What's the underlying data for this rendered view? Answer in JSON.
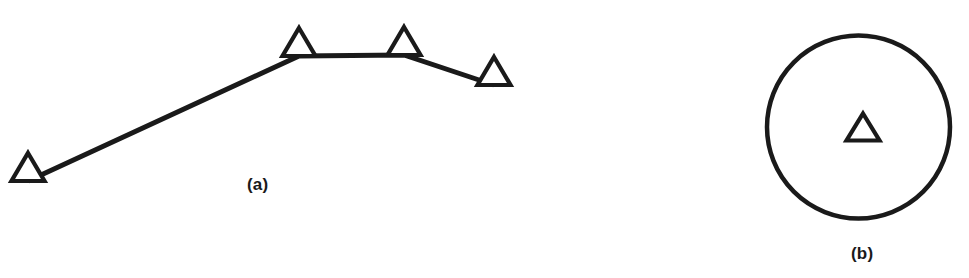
{
  "figure": {
    "background_color": "#ffffff",
    "stroke_color": "#1a1a1a",
    "width": 969,
    "height": 278
  },
  "panels": [
    {
      "id": "a",
      "caption": "(a)",
      "description": "open-triangle markers connected by straight line segments"
    },
    {
      "id": "b",
      "caption": "(b)",
      "description": "single open-triangle marker centered inside a large circle"
    }
  ],
  "chart_data": {
    "type": "line",
    "title": "",
    "xlabel": "",
    "ylabel": "",
    "grid": false,
    "legend": null,
    "xlim": [
      0,
      969
    ],
    "ylim": [
      278,
      0
    ],
    "marker": "open-triangle",
    "line_color": "#1a1a1a",
    "line_width": 5,
    "marker_line_width": 4,
    "series": [
      {
        "name": "panel-a-polyline",
        "panel": "a",
        "points": [
          {
            "x": 28,
            "y": 169
          },
          {
            "x": 299,
            "y": 44
          },
          {
            "x": 404,
            "y": 43
          },
          {
            "x": 494,
            "y": 73
          }
        ],
        "marker_width": 33,
        "marker_height": 28
      },
      {
        "name": "panel-b-point",
        "panel": "b",
        "points": [
          {
            "x": 863,
            "y": 129
          }
        ],
        "marker_width": 33,
        "marker_height": 27
      }
    ],
    "annotations": [
      {
        "name": "panel-b-circle",
        "shape": "circle",
        "cx": 858,
        "cy": 127,
        "r": 91,
        "stroke": "#1a1a1a",
        "stroke_width": 4.5,
        "fill": "none"
      },
      {
        "name": "caption-a",
        "text": "(a)",
        "x": 264,
        "y": 186
      },
      {
        "name": "caption-b",
        "text": "(b)",
        "x": 868,
        "y": 255
      }
    ]
  }
}
